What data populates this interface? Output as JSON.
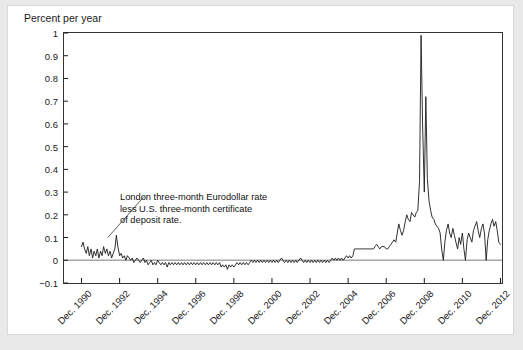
{
  "axis_title": "Percent per year",
  "annotation": {
    "line1": "London three-month Eurodollar rate",
    "line2": "less U.S. three-month certificate",
    "line3": "of deposit rate."
  },
  "caption": "",
  "colors": {
    "line": "#1a1a1a",
    "axis": "#1a1a1a",
    "zero_line": "#a6a6a6",
    "plot_border": "#333333",
    "background": "#ffffff",
    "page_background": "#e9e9e9"
  },
  "chart_data": {
    "type": "line",
    "title": "",
    "subtitle": "",
    "xlabel": "",
    "ylabel": "Percent per year",
    "grid": false,
    "legend": "none",
    "annotations": [
      {
        "text": "London three-month Eurodollar rate less U.S. three-month certificate of deposit rate.",
        "x": 1992.6,
        "y": 0.29,
        "leader_to_x": 1992.3,
        "leader_to_y": 0.1
      }
    ],
    "ylim": [
      -0.1,
      1.0
    ],
    "xlim": [
      1990.0,
      2013.0
    ],
    "ytick_labels": [
      "1",
      "0.9",
      "0.8",
      "0.7",
      "0.6",
      "0.5",
      "0.4",
      "0.3",
      "0.2",
      "0.1",
      "0",
      "-0.1"
    ],
    "yticks": [
      1,
      0.9,
      0.8,
      0.7,
      0.6,
      0.5,
      0.4,
      0.3,
      0.2,
      0.1,
      0,
      -0.1
    ],
    "xtick_labels": [
      "Dec. 1990",
      "Dec. 1992",
      "Dec. 1994",
      "Dec. 1996",
      "Dec. 1998",
      "Dec. 2000",
      "Dec. 2002",
      "Dec. 2004",
      "Dec. 2006",
      "Dec. 2008",
      "Dec. 2010",
      "Dec. 2012"
    ],
    "xticks": [
      1990.92,
      1992.92,
      1994.92,
      1996.92,
      1998.92,
      2000.92,
      2002.92,
      2004.92,
      2006.92,
      2008.92,
      2010.92,
      2012.92
    ],
    "reference_lines": [
      {
        "y": 0,
        "color": "#a6a6a6"
      }
    ],
    "series": [
      {
        "name": "London three-month Eurodollar rate less U.S. three-month certificate of deposit rate",
        "x": [
          1990.92,
          1991.0,
          1991.08,
          1991.17,
          1991.25,
          1991.33,
          1991.42,
          1991.5,
          1991.58,
          1991.67,
          1991.75,
          1991.83,
          1991.92,
          1992.0,
          1992.08,
          1992.17,
          1992.25,
          1992.33,
          1992.42,
          1992.5,
          1992.58,
          1992.67,
          1992.75,
          1992.83,
          1992.92,
          1993.0,
          1993.08,
          1993.17,
          1993.25,
          1993.33,
          1993.42,
          1993.5,
          1993.58,
          1993.67,
          1993.75,
          1993.83,
          1993.92,
          1994.0,
          1994.08,
          1994.17,
          1994.25,
          1994.33,
          1994.42,
          1994.5,
          1994.58,
          1994.67,
          1994.75,
          1994.83,
          1994.92,
          1995.0,
          1995.08,
          1995.17,
          1995.25,
          1995.33,
          1995.42,
          1995.5,
          1995.58,
          1995.67,
          1995.75,
          1995.83,
          1995.92,
          1996.0,
          1996.08,
          1996.17,
          1996.25,
          1996.33,
          1996.42,
          1996.5,
          1996.58,
          1996.67,
          1996.75,
          1996.83,
          1996.92,
          1997.0,
          1997.08,
          1997.17,
          1997.25,
          1997.33,
          1997.42,
          1997.5,
          1997.58,
          1997.67,
          1997.75,
          1997.83,
          1997.92,
          1998.0,
          1998.08,
          1998.17,
          1998.25,
          1998.33,
          1998.42,
          1998.5,
          1998.58,
          1998.67,
          1998.75,
          1998.83,
          1998.92,
          1999.0,
          1999.08,
          1999.17,
          1999.25,
          1999.33,
          1999.42,
          1999.5,
          1999.58,
          1999.67,
          1999.75,
          1999.83,
          1999.92,
          2000.0,
          2000.08,
          2000.17,
          2000.25,
          2000.33,
          2000.42,
          2000.5,
          2000.58,
          2000.67,
          2000.75,
          2000.83,
          2000.92,
          2001.0,
          2001.08,
          2001.17,
          2001.25,
          2001.33,
          2001.42,
          2001.5,
          2001.58,
          2001.67,
          2001.75,
          2001.83,
          2001.92,
          2002.0,
          2002.08,
          2002.17,
          2002.25,
          2002.33,
          2002.42,
          2002.5,
          2002.58,
          2002.67,
          2002.75,
          2002.83,
          2002.92,
          2003.0,
          2003.08,
          2003.17,
          2003.25,
          2003.33,
          2003.42,
          2003.5,
          2003.58,
          2003.67,
          2003.75,
          2003.83,
          2003.92,
          2004.0,
          2004.08,
          2004.17,
          2004.25,
          2004.33,
          2004.42,
          2004.5,
          2004.58,
          2004.67,
          2004.75,
          2004.83,
          2004.92,
          2005.0,
          2005.08,
          2005.17,
          2005.25,
          2005.33,
          2005.42,
          2005.5,
          2005.58,
          2005.67,
          2005.75,
          2005.83,
          2005.92,
          2006.0,
          2006.08,
          2006.17,
          2006.25,
          2006.33,
          2006.42,
          2006.5,
          2006.58,
          2006.67,
          2006.75,
          2006.83,
          2006.92,
          2007.0,
          2007.08,
          2007.17,
          2007.25,
          2007.33,
          2007.42,
          2007.5,
          2007.58,
          2007.67,
          2007.75,
          2007.83,
          2007.92,
          2008.0,
          2008.08,
          2008.17,
          2008.25,
          2008.33,
          2008.42,
          2008.5,
          2008.58,
          2008.67,
          2008.75,
          2008.83,
          2008.92,
          2009.0,
          2009.08,
          2009.17,
          2009.25,
          2009.33,
          2009.42,
          2009.5,
          2009.58,
          2009.67,
          2009.75,
          2009.83,
          2009.92,
          2010.0,
          2010.08,
          2010.17,
          2010.25,
          2010.33,
          2010.42,
          2010.5,
          2010.58,
          2010.67,
          2010.75,
          2010.83,
          2010.92,
          2011.0,
          2011.08,
          2011.17,
          2011.25,
          2011.33,
          2011.42,
          2011.5,
          2011.58,
          2011.67,
          2011.75,
          2011.83,
          2011.92,
          2012.0,
          2012.08,
          2012.17,
          2012.25,
          2012.33,
          2012.42,
          2012.5,
          2012.58,
          2012.67,
          2012.75,
          2012.83,
          2012.92
        ],
        "values": [
          0.06,
          0.08,
          0.05,
          0.03,
          0.06,
          0.02,
          0.05,
          0.01,
          0.04,
          0.02,
          0.05,
          0.01,
          0.04,
          0.02,
          0.06,
          0.03,
          0.05,
          0.02,
          0.04,
          0.01,
          0.03,
          0.05,
          0.11,
          0.06,
          0.02,
          0.03,
          0.01,
          0.02,
          0.0,
          0.02,
          0.01,
          0.0,
          0.01,
          -0.01,
          0.0,
          0.01,
          0.0,
          -0.01,
          0.0,
          0.01,
          -0.01,
          0.0,
          -0.02,
          -0.01,
          0.0,
          -0.02,
          -0.01,
          -0.02,
          0.0,
          -0.01,
          -0.02,
          -0.01,
          -0.02,
          -0.01,
          -0.03,
          -0.01,
          -0.02,
          -0.01,
          -0.02,
          -0.01,
          -0.02,
          -0.01,
          -0.02,
          -0.01,
          -0.02,
          -0.01,
          -0.02,
          -0.01,
          -0.02,
          -0.01,
          -0.02,
          -0.01,
          -0.02,
          -0.01,
          -0.02,
          -0.01,
          -0.02,
          -0.01,
          -0.02,
          -0.01,
          -0.02,
          -0.01,
          -0.02,
          -0.01,
          -0.02,
          -0.01,
          -0.02,
          -0.01,
          -0.03,
          -0.02,
          -0.03,
          -0.02,
          -0.04,
          -0.02,
          -0.03,
          -0.02,
          -0.03,
          -0.02,
          -0.01,
          -0.02,
          -0.01,
          -0.02,
          -0.01,
          -0.02,
          -0.01,
          -0.02,
          -0.01,
          0.0,
          -0.01,
          0.0,
          -0.01,
          0.0,
          -0.01,
          0.0,
          -0.01,
          0.0,
          -0.01,
          0.0,
          -0.01,
          0.0,
          -0.01,
          0.0,
          -0.01,
          0.0,
          -0.01,
          0.0,
          0.01,
          0.0,
          -0.01,
          0.0,
          -0.01,
          0.0,
          -0.01,
          0.0,
          -0.01,
          0.0,
          -0.01,
          0.0,
          0.01,
          0.0,
          -0.01,
          0.0,
          -0.01,
          0.0,
          -0.01,
          0.0,
          -0.01,
          0.0,
          -0.01,
          0.0,
          -0.01,
          0.0,
          -0.01,
          0.0,
          -0.01,
          0.0,
          -0.01,
          0.0,
          0.01,
          0.0,
          0.01,
          0.0,
          0.01,
          0.0,
          0.01,
          0.0,
          0.01,
          0.02,
          0.01,
          0.02,
          0.01,
          0.02,
          0.05,
          0.05,
          0.05,
          0.05,
          0.05,
          0.05,
          0.05,
          0.05,
          0.05,
          0.05,
          0.05,
          0.05,
          0.05,
          0.06,
          0.07,
          0.06,
          0.05,
          0.06,
          0.06,
          0.06,
          0.05,
          0.05,
          0.06,
          0.07,
          0.08,
          0.09,
          0.08,
          0.12,
          0.16,
          0.13,
          0.11,
          0.13,
          0.17,
          0.2,
          0.18,
          0.17,
          0.21,
          0.2,
          0.19,
          0.21,
          0.22,
          0.35,
          0.99,
          0.6,
          0.3,
          0.72,
          0.36,
          0.26,
          0.22,
          0.19,
          0.18,
          0.16,
          0.15,
          0.14,
          0.12,
          0.05,
          0.0,
          0.08,
          0.13,
          0.16,
          0.12,
          0.1,
          0.14,
          0.11,
          0.08,
          0.05,
          0.1,
          0.07,
          0.12,
          0.05,
          0.0,
          0.09,
          0.12,
          0.1,
          0.08,
          0.13,
          0.15,
          0.17,
          0.13,
          0.1,
          0.14,
          0.16,
          0.12,
          0.0,
          0.09,
          0.13,
          0.16,
          0.18,
          0.15,
          0.17,
          0.13,
          0.08,
          0.07
        ]
      }
    ]
  }
}
